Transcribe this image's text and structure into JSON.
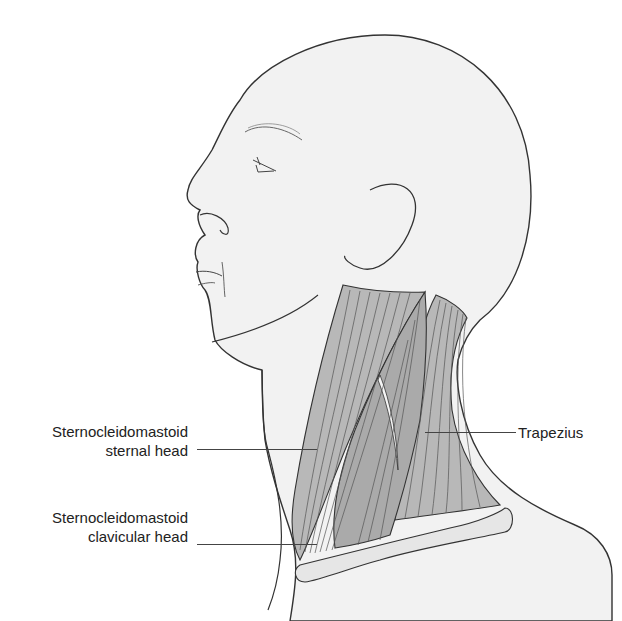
{
  "figure": {
    "colors": {
      "skin": "#f2f2f2",
      "outline": "#333333",
      "muscle": "#b8b8b8",
      "muscle_fiber": "#555555",
      "clavicle": "#e6e6e6",
      "text": "#222222"
    }
  },
  "labels": {
    "scm_sternal": {
      "line1": "Sternocleidomastoid",
      "line2": "sternal head"
    },
    "scm_clavicular": {
      "line1": "Sternocleidomastoid",
      "line2": "clavicular head"
    },
    "trapezius": {
      "text": "Trapezius"
    }
  }
}
